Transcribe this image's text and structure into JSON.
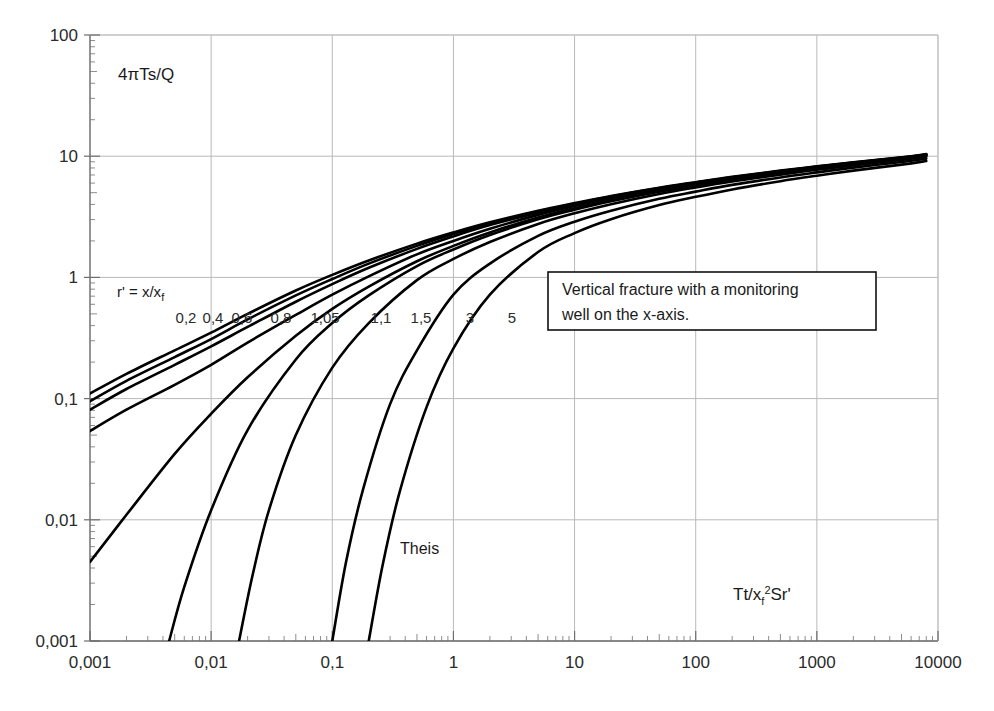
{
  "chart_data": {
    "type": "line",
    "title": "",
    "xlabel": "Tt/xf2Sr'",
    "ylabel": "4πTs/Q",
    "xscale": "log",
    "yscale": "log",
    "xlim": [
      0.001,
      10000
    ],
    "ylim": [
      0.001,
      100
    ],
    "grid": true,
    "grid_color": "#b9b9b9",
    "xticks": [
      "0,001",
      "0,01",
      "0,1",
      "1",
      "10",
      "100",
      "1000",
      "10000"
    ],
    "xtick_values": [
      0.001,
      0.01,
      0.1,
      1,
      10,
      100,
      1000,
      10000
    ],
    "yticks": [
      "0,001",
      "0,01",
      "0,1",
      "1",
      "10",
      "100"
    ],
    "ytick_values": [
      0.001,
      0.01,
      0.1,
      1,
      10,
      100
    ],
    "legend_position": "inline-on-curves",
    "series_parameter_label": "r' = x/xf",
    "annotations": [
      {
        "name": "note-box",
        "text_line_1": "Vertical fracture with a monitoring",
        "text_line_2": "well on the x-axis.",
        "x": 10,
        "y": 0.55,
        "boxed": true
      },
      {
        "name": "theis-curve-label",
        "text": "Theis",
        "x": 0.38,
        "y": 0.0038,
        "boxed": false
      }
    ],
    "curve_label_values": [
      "0,2",
      "0,4",
      "0,6",
      "0,8",
      "1,05",
      "1,1",
      "1,5",
      "3",
      "5"
    ],
    "series": [
      {
        "name": "0,2",
        "label": "0,2",
        "x": [
          0.001,
          0.002,
          0.005,
          0.01,
          0.02,
          0.05,
          0.1,
          0.2,
          0.5,
          1,
          2,
          5,
          10,
          20,
          50,
          100,
          200,
          500,
          1000,
          2000,
          5000,
          8000
        ],
        "values": [
          0.11,
          0.16,
          0.25,
          0.35,
          0.5,
          0.78,
          1.05,
          1.38,
          1.9,
          2.35,
          2.85,
          3.55,
          4.1,
          4.7,
          5.5,
          6.1,
          6.75,
          7.6,
          8.25,
          8.9,
          9.8,
          10.4
        ]
      },
      {
        "name": "0,4",
        "label": "0,4",
        "x": [
          0.001,
          0.002,
          0.005,
          0.01,
          0.02,
          0.05,
          0.1,
          0.2,
          0.5,
          1,
          2,
          5,
          10,
          20,
          50,
          100,
          200,
          500,
          1000,
          2000,
          5000,
          8000
        ],
        "values": [
          0.095,
          0.14,
          0.22,
          0.31,
          0.45,
          0.71,
          0.97,
          1.3,
          1.82,
          2.28,
          2.78,
          3.5,
          4.05,
          4.65,
          5.45,
          6.05,
          6.7,
          7.55,
          8.2,
          8.85,
          9.75,
          10.35
        ]
      },
      {
        "name": "0,6",
        "label": "0,6",
        "x": [
          0.001,
          0.002,
          0.005,
          0.01,
          0.02,
          0.05,
          0.1,
          0.2,
          0.5,
          1,
          2,
          5,
          10,
          20,
          50,
          100,
          200,
          500,
          1000,
          2000,
          5000,
          8000
        ],
        "values": [
          0.081,
          0.12,
          0.19,
          0.27,
          0.39,
          0.63,
          0.88,
          1.2,
          1.72,
          2.18,
          2.7,
          3.42,
          4.0,
          4.6,
          5.4,
          6.0,
          6.65,
          7.5,
          8.15,
          8.8,
          9.7,
          10.3
        ]
      },
      {
        "name": "0,8",
        "label": "0,8",
        "x": [
          0.001,
          0.002,
          0.005,
          0.01,
          0.02,
          0.05,
          0.1,
          0.2,
          0.5,
          1,
          2,
          5,
          10,
          20,
          50,
          100,
          200,
          500,
          1000,
          2000,
          5000,
          8000
        ],
        "values": [
          0.054,
          0.081,
          0.13,
          0.19,
          0.29,
          0.49,
          0.72,
          1.02,
          1.55,
          2.0,
          2.52,
          3.28,
          3.88,
          4.5,
          5.3,
          5.92,
          6.58,
          7.44,
          8.1,
          8.75,
          9.65,
          10.25
        ]
      },
      {
        "name": "1,05",
        "label": "1,05",
        "x": [
          0.001,
          0.002,
          0.005,
          0.01,
          0.02,
          0.05,
          0.1,
          0.2,
          0.5,
          1,
          2,
          5,
          10,
          20,
          50,
          100,
          200,
          500,
          1000,
          2000,
          5000,
          8000
        ],
        "values": [
          0.0045,
          0.011,
          0.035,
          0.075,
          0.15,
          0.33,
          0.55,
          0.84,
          1.36,
          1.82,
          2.35,
          3.12,
          3.72,
          4.35,
          5.18,
          5.8,
          6.46,
          7.32,
          7.98,
          8.65,
          9.55,
          10.15
        ]
      },
      {
        "name": "1,1",
        "label": "1,1",
        "x": [
          0.0045,
          0.006,
          0.01,
          0.02,
          0.05,
          0.1,
          0.2,
          0.5,
          1,
          2,
          5,
          10,
          20,
          50,
          100,
          200,
          500,
          1000,
          2000,
          5000,
          8000
        ],
        "values": [
          0.001,
          0.0028,
          0.012,
          0.055,
          0.21,
          0.42,
          0.71,
          1.24,
          1.7,
          2.24,
          3.02,
          3.62,
          4.25,
          5.1,
          5.72,
          6.38,
          7.25,
          7.9,
          8.58,
          9.48,
          10.08
        ]
      },
      {
        "name": "1,5",
        "label": "1,5",
        "x": [
          0.017,
          0.022,
          0.03,
          0.05,
          0.1,
          0.2,
          0.5,
          1,
          2,
          5,
          10,
          20,
          50,
          100,
          200,
          500,
          1000,
          2000,
          5000,
          8000
        ],
        "values": [
          0.001,
          0.0035,
          0.012,
          0.05,
          0.18,
          0.42,
          0.95,
          1.42,
          1.96,
          2.76,
          3.38,
          4.02,
          4.88,
          5.52,
          6.18,
          7.05,
          7.72,
          8.4,
          9.3,
          9.9
        ]
      },
      {
        "name": "3",
        "label": "3",
        "x": [
          0.1,
          0.13,
          0.18,
          0.3,
          0.5,
          1,
          2,
          5,
          10,
          20,
          50,
          100,
          200,
          500,
          1000,
          2000,
          5000,
          8000
        ],
        "values": [
          0.001,
          0.0045,
          0.018,
          0.09,
          0.25,
          0.72,
          1.3,
          2.2,
          2.88,
          3.55,
          4.45,
          5.1,
          5.8,
          6.68,
          7.35,
          8.05,
          8.95,
          9.55
        ]
      },
      {
        "name": "5",
        "label": "5",
        "x": [
          0.2,
          0.26,
          0.36,
          0.6,
          1,
          2,
          5,
          10,
          20,
          50,
          100,
          200,
          500,
          1000,
          2000,
          5000,
          8000
        ],
        "values": [
          0.001,
          0.0042,
          0.017,
          0.085,
          0.26,
          0.72,
          1.62,
          2.32,
          3.02,
          3.95,
          4.62,
          5.32,
          6.22,
          6.9,
          7.6,
          8.52,
          9.12
        ]
      }
    ],
    "curve_label_positions": [
      {
        "label": "0,2",
        "px": 186,
        "py": 323
      },
      {
        "label": "0,4",
        "px": 213,
        "py": 323
      },
      {
        "label": "0,6",
        "px": 242,
        "py": 323
      },
      {
        "label": "0,8",
        "px": 281,
        "py": 323
      },
      {
        "label": "1,05",
        "px": 325,
        "py": 323
      },
      {
        "label": "1,1",
        "px": 381,
        "py": 323
      },
      {
        "label": "1,5",
        "px": 421,
        "py": 323
      },
      {
        "label": "3",
        "px": 470,
        "py": 323
      },
      {
        "label": "5",
        "px": 512,
        "py": 323
      }
    ]
  }
}
